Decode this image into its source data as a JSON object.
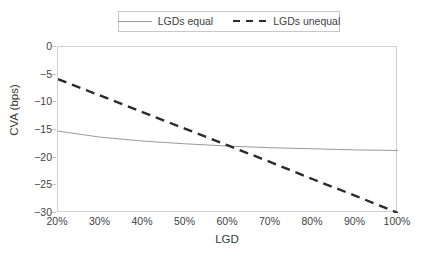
{
  "chart_data": {
    "type": "line",
    "title": "",
    "xlabel": "LGD",
    "ylabel": "CVA (bps)",
    "xlim": [
      20,
      100
    ],
    "ylim": [
      -30,
      0
    ],
    "grid": false,
    "legend_position": "top-center",
    "x": [
      20,
      30,
      40,
      50,
      60,
      70,
      80,
      90,
      100
    ],
    "xtick_labels": [
      "20%",
      "30%",
      "40%",
      "50%",
      "60%",
      "70%",
      "80%",
      "90%",
      "100%"
    ],
    "ytick_values": [
      0,
      -5,
      -10,
      -15,
      -20,
      -25,
      -30
    ],
    "ytick_labels": [
      "0",
      "−5",
      "−10",
      "−15",
      "−20",
      "−25",
      "−30"
    ],
    "series": [
      {
        "name": "LGDs equal",
        "style": "solid",
        "color": "#9a9a9a",
        "values": [
          -15.2,
          -16.3,
          -17.0,
          -17.5,
          -17.9,
          -18.2,
          -18.4,
          -18.6,
          -18.7
        ]
      },
      {
        "name": "LGDs unequal",
        "style": "dashed",
        "color": "#2b2b2b",
        "values": [
          -5.8,
          -8.8,
          -11.8,
          -14.8,
          -17.8,
          -20.8,
          -23.9,
          -26.9,
          -30.0
        ]
      }
    ],
    "annotations": []
  },
  "legend": {
    "entries": [
      {
        "label": "LGDs equal",
        "swatch": "solid-line-swatch"
      },
      {
        "label": "LGDs unequal",
        "swatch": "dashed-line-swatch"
      }
    ]
  },
  "axes": {
    "y_title": "CVA (bps)",
    "x_title": "LGD"
  }
}
